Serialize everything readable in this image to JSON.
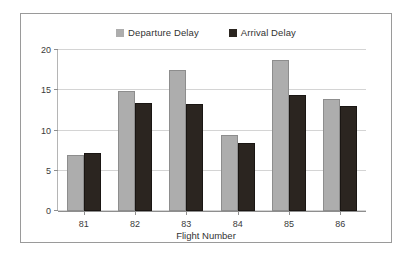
{
  "chart_data": {
    "type": "bar",
    "title": "",
    "xlabel": "Flight Number",
    "ylabel": "",
    "categories": [
      "81",
      "82",
      "83",
      "84",
      "85",
      "86"
    ],
    "series": [
      {
        "name": "Departure Delay",
        "color": "#adadad",
        "values": [
          7.0,
          14.9,
          17.5,
          9.4,
          18.8,
          13.9
        ]
      },
      {
        "name": "Arrival Delay",
        "color": "#2b2520",
        "values": [
          7.2,
          13.4,
          13.3,
          8.5,
          14.4,
          13.0
        ]
      }
    ],
    "ylim": [
      0,
      20
    ],
    "yticks": [
      0,
      5,
      10,
      15,
      20
    ],
    "ytick_labels": [
      "0",
      "5",
      "10",
      "15",
      "20"
    ],
    "grid": true,
    "legend_position": "top-center"
  },
  "frame": {
    "border_color": "#9a9a9a",
    "background": "#ffffff"
  }
}
